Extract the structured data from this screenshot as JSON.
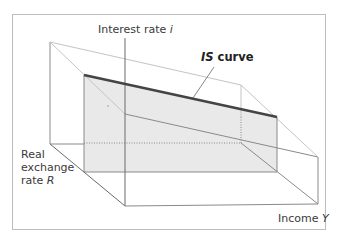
{
  "diagram": {
    "title": "",
    "axes": {
      "interest_rate": {
        "label": "Interest rate ",
        "symbol": "i"
      },
      "real_exchange_rate": {
        "label_line1": "Real",
        "label_line2": "exchange",
        "label_line3": "rate ",
        "symbol": "R"
      },
      "income": {
        "label": "Income ",
        "symbol": "Y"
      }
    },
    "curve": {
      "label_symbol": "IS",
      "label_text": " curve"
    },
    "colors": {
      "frame": "#bdbdbd",
      "box_lines": "#8a8a8a",
      "light_lines": "#c4c4c4",
      "is_curve": "#444444",
      "plane_fill": "#e9e9e9"
    }
  }
}
